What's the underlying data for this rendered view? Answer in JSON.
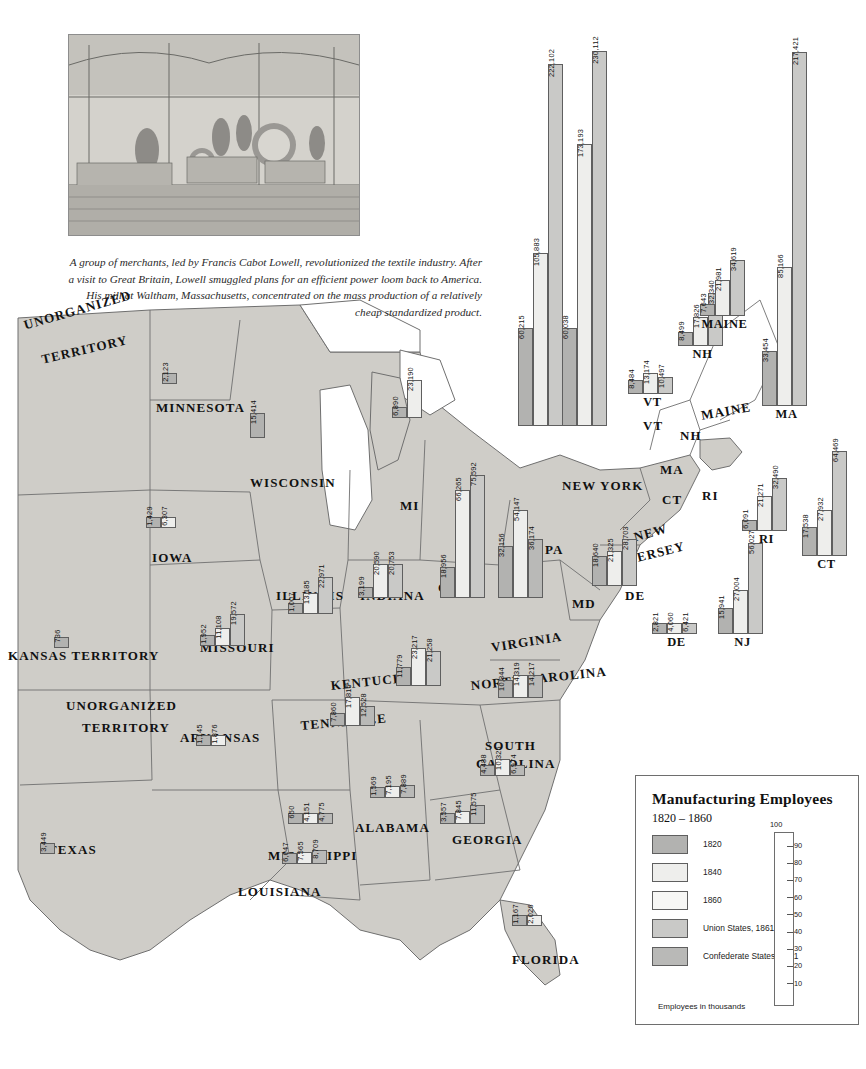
{
  "caption": {
    "text": "A group of merchants, led by Francis Cabot Lowell, revolutionized the textile industry. After a visit to Great Britain, Lowell smuggled plans for an efficient power loom back to America. His mill at Waltham, Massachusetts, concentrated on the mass production of a relatively cheap standardized product."
  },
  "legend": {
    "title": "Manufacturing Employees",
    "subtitle": "1820 – 1860",
    "items": [
      {
        "label": "1820",
        "color": "#b2b2b0"
      },
      {
        "label": "1840",
        "color": "#eeeeec"
      },
      {
        "label": "1860",
        "color": "#f7f7f5"
      },
      {
        "label": "Union States, 1861",
        "color": "#c9c9c7"
      },
      {
        "label": "Confederate States, 1861",
        "color": "#b9b9b7"
      }
    ],
    "scale_top": "100",
    "scale_ticks": [
      "90",
      "80",
      "70",
      "60",
      "50",
      "40",
      "30",
      "20",
      "10"
    ],
    "footnote": "Employees in thousands"
  },
  "map_labels": [
    {
      "name": "UNORGANIZED TERRITORY",
      "line1": "UNORGANIZED",
      "line2": "TERRITORY"
    },
    {
      "name": "MINNESOTA"
    },
    {
      "name": "WISCONSIN"
    },
    {
      "name": "MI"
    },
    {
      "name": "IOWA"
    },
    {
      "name": "ILLINOIS"
    },
    {
      "name": "INDIANA"
    },
    {
      "name": "OHIO"
    },
    {
      "name": "KANSAS TERRITORY"
    },
    {
      "name": "MISSOURI"
    },
    {
      "name": "KENTUCKY"
    },
    {
      "name": "TENNESSEE"
    },
    {
      "name": "ARKANSAS"
    },
    {
      "name": "MISSISSIPPI"
    },
    {
      "name": "LOUISIANA"
    },
    {
      "name": "ALABAMA"
    },
    {
      "name": "GEORGIA"
    },
    {
      "name": "FLORIDA"
    },
    {
      "name": "TEXAS"
    },
    {
      "name": "VIRGINIA"
    },
    {
      "name": "NORTH CAROLINA"
    },
    {
      "name": "SOUTH CAROLINA"
    },
    {
      "name": "NEW YORK"
    },
    {
      "name": "PA"
    },
    {
      "name": "NEW JERSEY"
    },
    {
      "name": "MD"
    },
    {
      "name": "DE"
    },
    {
      "name": "MAINE"
    },
    {
      "name": "VT"
    },
    {
      "name": "NH"
    },
    {
      "name": "MA"
    },
    {
      "name": "CT"
    },
    {
      "name": "RI"
    }
  ],
  "chart_data": {
    "type": "bar",
    "title": "Manufacturing Employees",
    "subtitle": "1820 – 1860",
    "ylabel": "Employees in thousands",
    "xlabel": "",
    "categories": [
      "1820",
      "1840",
      "1860"
    ],
    "ylim": [
      0,
      100
    ],
    "legend_position": "bottom-right",
    "grid": false,
    "note": "One small grouped bar chart per state, positioned on a map of the eastern United States. Values are numbers of manufacturing employees.",
    "states": [
      {
        "code": "NY",
        "label": "NEW YORK",
        "side": "union",
        "values": [
          60215,
          105883,
          222102
        ],
        "labels": [
          "60,215",
          "105,883",
          "222,102"
        ]
      },
      {
        "code": "PA",
        "label": "PA",
        "side": "union",
        "values": [
          60038,
          173193,
          230112
        ],
        "labels": [
          "60,038",
          "173,193",
          "230,112"
        ]
      },
      {
        "code": "MA",
        "label": "MA",
        "side": "union",
        "values": [
          33454,
          85166,
          217421
        ],
        "labels": [
          "33,454",
          "85,166",
          "217,421"
        ]
      },
      {
        "code": "CT",
        "label": "CT",
        "side": "union",
        "values": [
          17538,
          27932,
          64469
        ],
        "labels": [
          "17,538",
          "27,932",
          "64,469"
        ]
      },
      {
        "code": "RI",
        "label": "RI",
        "side": "union",
        "values": [
          6091,
          21271,
          32490
        ],
        "labels": [
          "6,091",
          "21,271",
          "32,490"
        ]
      },
      {
        "code": "NJ",
        "label": "NJ",
        "side": "union",
        "values": [
          15941,
          27004,
          56027
        ],
        "labels": [
          "15,941",
          "27,004",
          "56,027"
        ]
      },
      {
        "code": "NH",
        "label": "NH",
        "side": "union",
        "values": [
          8499,
          17826,
          32340
        ],
        "labels": [
          "8,499",
          "17,826",
          "32,340"
        ]
      },
      {
        "code": "VT",
        "label": "VT",
        "side": "union",
        "values": [
          8484,
          13174,
          10497
        ],
        "labels": [
          "8,484",
          "13,174",
          "10,497"
        ]
      },
      {
        "code": "ME",
        "label": "MAINE",
        "side": "union",
        "values": [
          7643,
          21981,
          34619
        ],
        "labels": [
          "7,643",
          "21,981",
          "34,619"
        ]
      },
      {
        "code": "DE",
        "label": "DE",
        "side": "union",
        "values": [
          2821,
          4060,
          6421
        ],
        "labels": [
          "2,821",
          "4,060",
          "6,421"
        ]
      },
      {
        "code": "MD",
        "label": "MD",
        "side": "union",
        "values": [
          18640,
          21325,
          28703
        ],
        "labels": [
          "18,640",
          "21,325",
          "28,703"
        ]
      },
      {
        "code": "OH",
        "label": "OHIO",
        "side": "union",
        "values": [
          18956,
          66265,
          75592
        ],
        "labels": [
          "18,956",
          "66,265",
          "75,592"
        ]
      },
      {
        "code": "MI",
        "label": "MI",
        "side": "union",
        "values": [
          6890,
          23190,
          23190
        ],
        "labels": [
          "6,890",
          "23,190",
          ""
        ]
      },
      {
        "code": "IN",
        "label": "INDIANA",
        "side": "union",
        "values": [
          3199,
          20590,
          20753
        ],
        "labels": [
          "3,199",
          "20,590",
          "20,753"
        ]
      },
      {
        "code": "IL",
        "label": "ILLINOIS",
        "side": "union",
        "values": [
          1007,
          13185,
          22971
        ],
        "labels": [
          "1,007",
          "13,185",
          "22,971"
        ]
      },
      {
        "code": "WI",
        "label": "WISCONSIN",
        "side": "union",
        "values": [
          15414,
          15414,
          15414
        ],
        "labels": [
          "15,414",
          "",
          ""
        ]
      },
      {
        "code": "MN",
        "label": "MINNESOTA",
        "side": "union",
        "values": [
          2123,
          2123,
          2123
        ],
        "labels": [
          "2,123",
          "",
          ""
        ]
      },
      {
        "code": "IA",
        "label": "IOWA",
        "side": "union",
        "values": [
          1429,
          6307,
          6307
        ],
        "labels": [
          "1,429",
          "6,307",
          ""
        ]
      },
      {
        "code": "MO",
        "label": "MISSOURI",
        "side": "union",
        "values": [
          1952,
          11108,
          19572
        ],
        "labels": [
          "1,952",
          "11,108",
          "19,572"
        ]
      },
      {
        "code": "KS",
        "label": "KANSAS TERRITORY",
        "side": "union",
        "values": [
          736,
          736,
          736
        ],
        "labels": [
          "736",
          "",
          ""
        ]
      },
      {
        "code": "KY",
        "label": "KENTUCKY",
        "side": "union",
        "values": [
          11779,
          23217,
          21258
        ],
        "labels": [
          "11,779",
          "23,217",
          "21,258"
        ]
      },
      {
        "code": "VA",
        "label": "VIRGINIA",
        "side": "confed",
        "values": [
          32156,
          54147,
          36174
        ],
        "labels": [
          "32,156",
          "54,147",
          "36,174"
        ]
      },
      {
        "code": "NC",
        "label": "NORTH CAROLINA",
        "side": "confed",
        "values": [
          10844,
          14319,
          14217
        ],
        "labels": [
          "10,844",
          "14,319",
          "14,217"
        ]
      },
      {
        "code": "SC",
        "label": "SOUTH CAROLINA",
        "side": "confed",
        "values": [
          4488,
          10325,
          6974
        ],
        "labels": [
          "4,488",
          "10,325",
          "6,974"
        ]
      },
      {
        "code": "GA",
        "label": "GEORGIA",
        "side": "confed",
        "values": [
          3557,
          7845,
          11575
        ],
        "labels": [
          "3,557",
          "7,845",
          "11,575"
        ]
      },
      {
        "code": "AL",
        "label": "ALABAMA",
        "side": "confed",
        "values": [
          1569,
          7195,
          7889
        ],
        "labels": [
          "1,569",
          "7,195",
          "7,889"
        ]
      },
      {
        "code": "MS",
        "label": "MISSISSIPPI",
        "side": "confed",
        "values": [
          650,
          4151,
          4775
        ],
        "labels": [
          "650",
          "4,151",
          "4,775"
        ]
      },
      {
        "code": "LA",
        "label": "LOUISIANA",
        "side": "confed",
        "values": [
          6047,
          7565,
          8709
        ],
        "labels": [
          "6,047",
          "7,565",
          "8,709"
        ]
      },
      {
        "code": "AR",
        "label": "ARKANSAS",
        "side": "confed",
        "values": [
          1145,
          1876,
          1876
        ],
        "labels": [
          "1,145",
          "1,876",
          ""
        ]
      },
      {
        "code": "TN",
        "label": "TENNESSEE",
        "side": "confed",
        "values": [
          7860,
          17815,
          12528
        ],
        "labels": [
          "7,860",
          "17,815",
          "12,528"
        ]
      },
      {
        "code": "TX",
        "label": "TEXAS",
        "side": "confed",
        "values": [
          3449,
          3449,
          3449
        ],
        "labels": [
          "3,449",
          "",
          ""
        ]
      },
      {
        "code": "FL",
        "label": "FLORIDA",
        "side": "confed",
        "values": [
          1167,
          2026,
          2026
        ],
        "labels": [
          "1,167",
          "2,026",
          ""
        ]
      }
    ]
  }
}
